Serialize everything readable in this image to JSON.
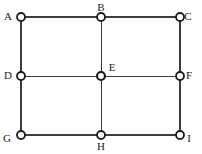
{
  "figure": {
    "kind": "grid-graph-diagram",
    "width": 202,
    "height": 154,
    "background_color": "#ffffff",
    "line_color": "#3c3c3c",
    "node_stroke_color": "#1b1b1b",
    "node_fill_color": "#ffffff",
    "label_color": "#1b1b1b"
  },
  "chart_data": {
    "type": "scatter",
    "title": "",
    "xlabel": "",
    "ylabel": "",
    "grid": true,
    "legend": "none",
    "xlim": [
      0,
      2
    ],
    "ylim": [
      0,
      2
    ],
    "x_tick_labels": [
      "0",
      "1",
      "2"
    ],
    "y_tick_labels": [
      "0",
      "1",
      "2"
    ],
    "nodes": [
      {
        "name": "A",
        "label": "A",
        "col": 0,
        "row": 0,
        "x": 21,
        "y": 17,
        "px": 21,
        "py": 17,
        "label_x": 8,
        "label_y": 11,
        "label_pos": "left",
        "marker": "open-circle",
        "radius": 4.0,
        "stroke_width": 1.8
      },
      {
        "name": "B",
        "label": "B",
        "col": 1,
        "row": 0,
        "x": 101,
        "y": 17,
        "px": 101,
        "py": 17,
        "label_x": 101,
        "label_y": 2,
        "label_pos": "above",
        "marker": "open-circle",
        "radius": 4.0,
        "stroke_width": 1.8
      },
      {
        "name": "C",
        "label": "C",
        "col": 2,
        "row": 0,
        "x": 180,
        "y": 17,
        "px": 180,
        "py": 17,
        "label_x": 188,
        "label_y": 11,
        "label_pos": "right",
        "marker": "open-circle",
        "radius": 4.0,
        "stroke_width": 1.8
      },
      {
        "name": "D",
        "label": "D",
        "col": 0,
        "row": 1,
        "x": 21,
        "y": 76,
        "px": 21,
        "py": 76,
        "label_x": 8,
        "label_y": 70,
        "label_pos": "left",
        "marker": "open-circle",
        "radius": 4.0,
        "stroke_width": 1.8
      },
      {
        "name": "E",
        "label": "E",
        "col": 1,
        "row": 1,
        "x": 101,
        "y": 76,
        "px": 101,
        "py": 76,
        "label_x": 112,
        "label_y": 62,
        "label_pos": "above-right",
        "marker": "open-circle",
        "radius": 4.0,
        "stroke_width": 2.2
      },
      {
        "name": "F",
        "label": "F",
        "col": 2,
        "row": 1,
        "x": 180,
        "y": 76,
        "px": 180,
        "py": 76,
        "label_x": 189,
        "label_y": 70,
        "label_pos": "right",
        "marker": "open-circle",
        "radius": 4.0,
        "stroke_width": 1.8
      },
      {
        "name": "G",
        "label": "G",
        "col": 0,
        "row": 2,
        "x": 21,
        "y": 135,
        "px": 21,
        "py": 135,
        "label_x": 7,
        "label_y": 133,
        "label_pos": "below-left",
        "marker": "open-circle",
        "radius": 4.0,
        "stroke_width": 1.8
      },
      {
        "name": "H",
        "label": "H",
        "col": 1,
        "row": 2,
        "x": 101,
        "y": 135,
        "px": 101,
        "py": 135,
        "label_x": 101,
        "label_y": 141,
        "label_pos": "below",
        "marker": "open-circle",
        "radius": 4.0,
        "stroke_width": 1.8
      },
      {
        "name": "I",
        "label": "I",
        "col": 2,
        "row": 2,
        "x": 180,
        "y": 135,
        "px": 180,
        "py": 135,
        "label_x": 189,
        "label_y": 133,
        "label_pos": "below-right",
        "marker": "open-circle",
        "radius": 4.0,
        "stroke_width": 1.8
      }
    ],
    "edges": [
      {
        "name": "edge-A-B",
        "from": "A",
        "to": "B",
        "orientation": "horizontal",
        "x1": 21,
        "y1": 17,
        "x2": 101,
        "y2": 17,
        "width": 1.2
      },
      {
        "name": "edge-B-C",
        "from": "B",
        "to": "C",
        "orientation": "horizontal",
        "x1": 101,
        "y1": 17,
        "x2": 180,
        "y2": 17,
        "width": 1.2
      },
      {
        "name": "edge-D-E",
        "from": "D",
        "to": "E",
        "orientation": "horizontal",
        "x1": 21,
        "y1": 76,
        "x2": 101,
        "y2": 76,
        "width": 1.0
      },
      {
        "name": "edge-E-F",
        "from": "E",
        "to": "F",
        "orientation": "horizontal",
        "x1": 101,
        "y1": 76,
        "x2": 180,
        "y2": 76,
        "width": 1.0
      },
      {
        "name": "edge-G-H",
        "from": "G",
        "to": "H",
        "orientation": "horizontal",
        "x1": 21,
        "y1": 135,
        "x2": 101,
        "y2": 135,
        "width": 1.2
      },
      {
        "name": "edge-H-I",
        "from": "H",
        "to": "I",
        "orientation": "horizontal",
        "x1": 101,
        "y1": 135,
        "x2": 180,
        "y2": 135,
        "width": 1.2
      },
      {
        "name": "edge-A-D",
        "from": "A",
        "to": "D",
        "orientation": "vertical",
        "x1": 21,
        "y1": 17,
        "x2": 21,
        "y2": 76,
        "width": 1.2
      },
      {
        "name": "edge-D-G",
        "from": "D",
        "to": "G",
        "orientation": "vertical",
        "x1": 21,
        "y1": 76,
        "x2": 21,
        "y2": 135,
        "width": 1.2
      },
      {
        "name": "edge-B-E",
        "from": "B",
        "to": "E",
        "orientation": "vertical",
        "x1": 101,
        "y1": 17,
        "x2": 101,
        "y2": 76,
        "width": 1.0
      },
      {
        "name": "edge-E-H",
        "from": "E",
        "to": "H",
        "orientation": "vertical",
        "x1": 101,
        "y1": 76,
        "x2": 101,
        "y2": 135,
        "width": 1.0
      },
      {
        "name": "edge-C-F",
        "from": "C",
        "to": "F",
        "orientation": "vertical",
        "x1": 180,
        "y1": 17,
        "x2": 180,
        "y2": 76,
        "width": 1.2
      },
      {
        "name": "edge-F-I",
        "from": "F",
        "to": "I",
        "orientation": "vertical",
        "x1": 180,
        "y1": 76,
        "x2": 180,
        "y2": 135,
        "width": 1.2
      }
    ],
    "node_count": 9,
    "edge_count": 12
  }
}
